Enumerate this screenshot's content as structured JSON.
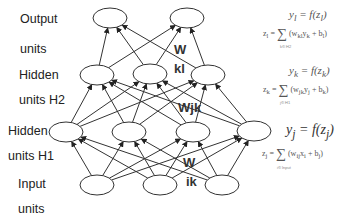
{
  "layer_labels": [
    {
      "id": "output-1",
      "text": "Output",
      "x": 20,
      "y": 12
    },
    {
      "id": "output-2",
      "text": "units",
      "x": 20,
      "y": 42
    },
    {
      "id": "h2-1",
      "text": "Hidden",
      "x": 19,
      "y": 68
    },
    {
      "id": "h2-2",
      "text": "units H2",
      "x": 19,
      "y": 93
    },
    {
      "id": "h1-1",
      "text": "Hidden",
      "x": 8,
      "y": 124
    },
    {
      "id": "h1-2",
      "text": "units H1",
      "x": 8,
      "y": 149
    },
    {
      "id": "input-1",
      "text": "Input",
      "x": 18,
      "y": 177
    },
    {
      "id": "input-2",
      "text": "units",
      "x": 18,
      "y": 202
    }
  ],
  "nodes": {
    "output": [
      [
        110,
        18
      ],
      [
        187,
        18
      ]
    ],
    "hidden2": [
      [
        97,
        75
      ],
      [
        150,
        74
      ],
      [
        208,
        75
      ]
    ],
    "hidden1": [
      [
        66,
        132
      ],
      [
        129,
        132
      ],
      [
        193,
        132
      ],
      [
        254,
        131
      ]
    ],
    "input": [
      [
        97,
        185
      ],
      [
        160,
        185
      ],
      [
        222,
        185
      ]
    ]
  },
  "weights": [
    {
      "id": "w-kl-a",
      "text": "W",
      "x": 174,
      "y": 42
    },
    {
      "id": "w-kl-b",
      "text": "kl",
      "x": 174,
      "y": 61
    },
    {
      "id": "w-jk",
      "text": "Wjk",
      "x": 178,
      "y": 100
    },
    {
      "id": "w-ik-a",
      "text": "W",
      "x": 183,
      "y": 155
    },
    {
      "id": "w-ik-b",
      "text": "ik",
      "x": 186,
      "y": 174
    }
  ],
  "equations": {
    "output": {
      "y": "y",
      "y_sub": "l",
      "eq": " = f(z",
      "z_sub": "l",
      "close": ")",
      "z_line": "z",
      "z_line_sub": "l",
      "sum_under": "k∈ H2",
      "sum_term": "(w",
      "sum_term_sub": "kl",
      "sum_rest": "y",
      "sum_rest_sub": "k",
      "bias": " + b",
      "bias_sub": "l",
      "end": ")"
    },
    "hidden2": {
      "y": "y",
      "y_sub": "k",
      "eq": " = f(z",
      "z_sub": "k",
      "close": ")",
      "z_line": "z",
      "z_line_sub": "k",
      "sum_under": "j∈ H1",
      "sum_term": "(w",
      "sum_term_sub": "jk",
      "sum_rest": "y",
      "sum_rest_sub": "j",
      "bias": " + b",
      "bias_sub": "k",
      "end": ")"
    },
    "hidden1": {
      "y": "y",
      "y_sub": "j",
      "eq": " = f(z",
      "z_sub": "j",
      "close": ")",
      "z_line": "z",
      "z_line_sub": "j",
      "sum_under": "i∈ Input",
      "sum_term": "(w",
      "sum_term_sub": "ij",
      "sum_rest": "x",
      "sum_rest_sub": "i",
      "bias": " + b",
      "bias_sub": "j",
      "end": ")"
    }
  },
  "colors": {
    "line": "#333333",
    "node_fill": "#ffffff",
    "text": "#222222",
    "equation": "#555555"
  }
}
